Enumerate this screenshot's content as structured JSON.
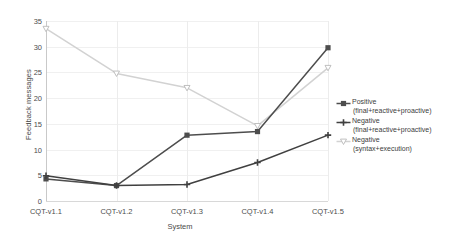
{
  "chart_data": {
    "type": "line",
    "title": "",
    "xlabel": "System",
    "ylabel": "Feedback messages",
    "categories": [
      "CQT-v1.1",
      "CQT-v1.2",
      "CQT-v1.3",
      "CQT-v1.4",
      "CQT-v1.5"
    ],
    "ylim": [
      0,
      35
    ],
    "yticks": [
      0,
      5,
      10,
      15,
      20,
      25,
      30,
      35
    ],
    "grid": true,
    "legend_position": "right",
    "series": [
      {
        "name": "Positive (final+reactive+proactive)",
        "legend_line1": "Positive",
        "legend_line2": "(final+reactive+proactive)",
        "color": "#4d4d4d",
        "marker": "square",
        "values": [
          4.3,
          3.0,
          12.8,
          13.5,
          29.8
        ]
      },
      {
        "name": "Negative (final+reactive+proactive)",
        "legend_line1": "Negative",
        "legend_line2": "(final+reactive+proactive)",
        "color": "#404040",
        "marker": "plus",
        "values": [
          4.9,
          3.0,
          3.2,
          7.5,
          12.8
        ]
      },
      {
        "name": "Negative (syntax+execution)",
        "legend_line1": "Negative",
        "legend_line2": "(syntax+execution)",
        "color": "#d2d2d2",
        "marker": "triangle-down",
        "values": [
          33.5,
          24.8,
          22.0,
          14.6,
          25.9
        ]
      }
    ]
  }
}
